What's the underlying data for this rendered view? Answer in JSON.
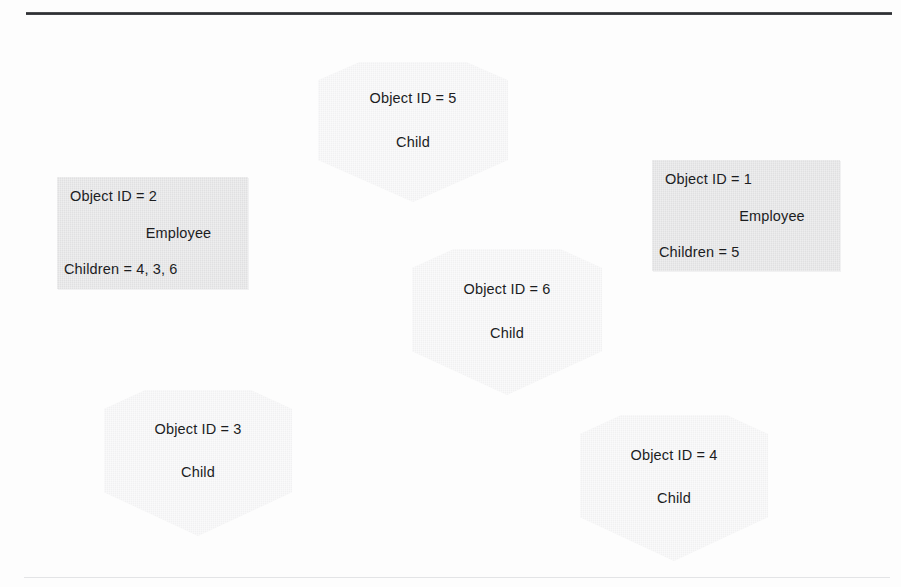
{
  "figure": {
    "kind": "object-diagram",
    "rules": {
      "top_line_color": "#2b2d30",
      "bottom_line_color": "#e3e4e6"
    },
    "palette": {
      "rectangle_fill": "#e0e0e1",
      "hexagon_fill": "#f1f1f2",
      "text_color": "#1c1d1f",
      "page_background": "#fdfdfd"
    }
  },
  "nodes": [
    {
      "id": "5",
      "shape": "hexagon",
      "line1": "Object ID = 5",
      "line2": "Child",
      "line3": ""
    },
    {
      "id": "2",
      "shape": "rectangle",
      "line1": "Object ID = 2",
      "line2": "Employee",
      "line3": "Children = 4, 3, 6"
    },
    {
      "id": "1",
      "shape": "rectangle",
      "line1": "Object ID = 1",
      "line2": "Employee",
      "line3": "Children = 5"
    },
    {
      "id": "6",
      "shape": "hexagon",
      "line1": "Object ID = 6",
      "line2": "Child",
      "line3": ""
    },
    {
      "id": "3",
      "shape": "hexagon",
      "line1": "Object ID = 3",
      "line2": "Child",
      "line3": ""
    },
    {
      "id": "4",
      "shape": "hexagon",
      "line1": "Object ID = 4",
      "line2": "Child",
      "line3": ""
    }
  ]
}
